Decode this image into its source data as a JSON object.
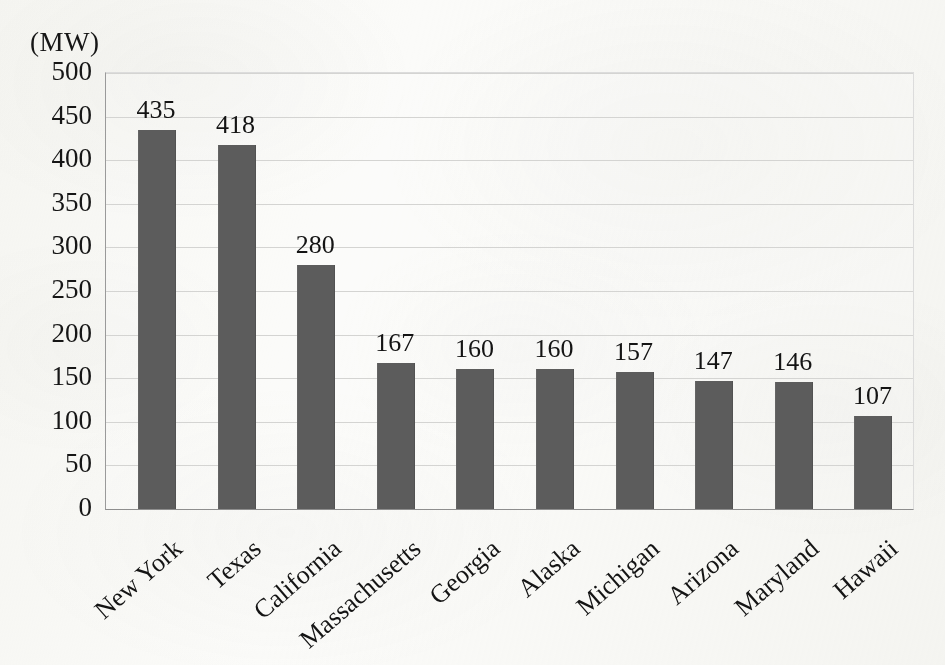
{
  "chart_data": {
    "type": "bar",
    "title": "",
    "subtitle": "",
    "xlabel": "",
    "ylabel": "(MW)",
    "unit_label": "(MW)",
    "ylim": [
      0,
      500
    ],
    "ytick_step": 50,
    "yticks": [
      "500",
      "450",
      "400",
      "350",
      "300",
      "250",
      "200",
      "150",
      "100",
      "50",
      "0"
    ],
    "ytick_values": [
      500,
      450,
      400,
      350,
      300,
      250,
      200,
      150,
      100,
      50,
      0
    ],
    "grid": true,
    "grid_axis": "y",
    "legend": false,
    "legend_position": "none",
    "data_labels": true,
    "category_label_rotation": -41,
    "categories": [
      "New York",
      "Texas",
      "California",
      "Massachusetts",
      "Georgia",
      "Alaska",
      "Michigan",
      "Arizona",
      "Maryland",
      "Hawaii"
    ],
    "values": [
      435,
      418,
      280,
      167,
      160,
      160,
      157,
      147,
      146,
      107
    ],
    "value_labels": [
      "435",
      "418",
      "280",
      "167",
      "160",
      "160",
      "157",
      "147",
      "146",
      "107"
    ],
    "series": [
      {
        "name": "",
        "values": [
          435,
          418,
          280,
          167,
          160,
          160,
          157,
          147,
          146,
          107
        ]
      }
    ],
    "colors": {
      "bar_fill": "#5c5c5c",
      "gridline": "#d4d4d2",
      "axis_line": "#8e8e8e",
      "text": "#141414",
      "background": "#fbfbf9"
    }
  }
}
